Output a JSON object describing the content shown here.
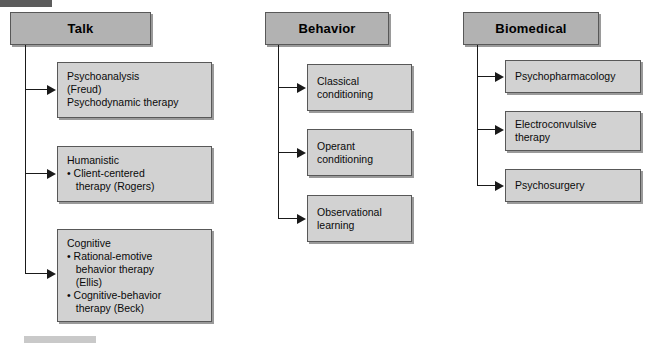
{
  "diagram": {
    "colors": {
      "header_fill": "#b2b2b2",
      "box_fill": "#d2d2d2",
      "border": "#585858",
      "connector": "#1a1a1a",
      "shadow": "#9a9a9a",
      "page_background": "#ffffff",
      "crop_bar_top": "#5c5c5c",
      "crop_bar_bottom": "#c9c9c9"
    },
    "columns": [
      {
        "id": "talk",
        "header": "Talk",
        "items": [
          {
            "id": "psychoanalysis",
            "lines": [
              "Psychoanalysis",
              "(Freud)",
              "Psychodynamic therapy"
            ]
          },
          {
            "id": "humanistic",
            "lines": [
              "Humanistic",
              "• Client-centered",
              "   therapy (Rogers)"
            ]
          },
          {
            "id": "cognitive",
            "lines": [
              "Cognitive",
              "• Rational-emotive",
              "   behavior therapy",
              "   (Ellis)",
              "• Cognitive-behavior",
              "   therapy (Beck)"
            ]
          }
        ]
      },
      {
        "id": "behavior",
        "header": "Behavior",
        "items": [
          {
            "id": "classical-conditioning",
            "lines": [
              "Classical",
              "conditioning"
            ]
          },
          {
            "id": "operant-conditioning",
            "lines": [
              "Operant",
              "conditioning"
            ]
          },
          {
            "id": "observational-learning",
            "lines": [
              "Observational",
              "learning"
            ]
          }
        ]
      },
      {
        "id": "biomedical",
        "header": "Biomedical",
        "items": [
          {
            "id": "psychopharmacology",
            "lines": [
              "Psychopharmacology"
            ]
          },
          {
            "id": "electroconvulsive-therapy",
            "lines": [
              "Electroconvulsive",
              "therapy"
            ]
          },
          {
            "id": "psychosurgery",
            "lines": [
              "Psychosurgery"
            ]
          }
        ]
      }
    ]
  }
}
